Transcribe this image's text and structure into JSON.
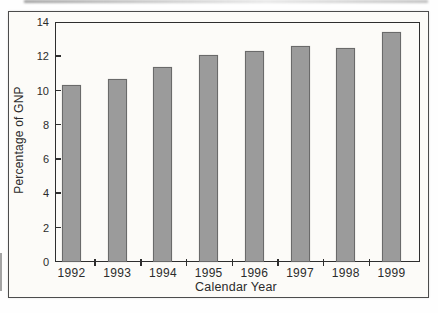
{
  "figure": {
    "background": "#fcfbf8",
    "border_color": "#4c4c4c",
    "frame_color": "#2e2e2e",
    "text_color": "#2b2b2b"
  },
  "chart_data": {
    "type": "bar",
    "title": "",
    "categories": [
      "1992",
      "1993",
      "1994",
      "1995",
      "1996",
      "1997",
      "1998",
      "1999"
    ],
    "values": [
      10.3,
      10.7,
      11.4,
      12.1,
      12.3,
      12.6,
      12.5,
      13.4
    ],
    "xlabel": "Calendar Year",
    "ylabel": "Percentage of GNP",
    "ylim": [
      0,
      14
    ],
    "yticks": [
      0,
      2,
      4,
      6,
      8,
      10,
      12,
      14
    ],
    "ytick_labels": [
      "0",
      "2",
      "4",
      "6",
      "8",
      "10",
      "12",
      "14"
    ],
    "grid": false,
    "legend": null,
    "bar_fill": "#9b9b9b",
    "bar_border": "#6a6a6a"
  }
}
